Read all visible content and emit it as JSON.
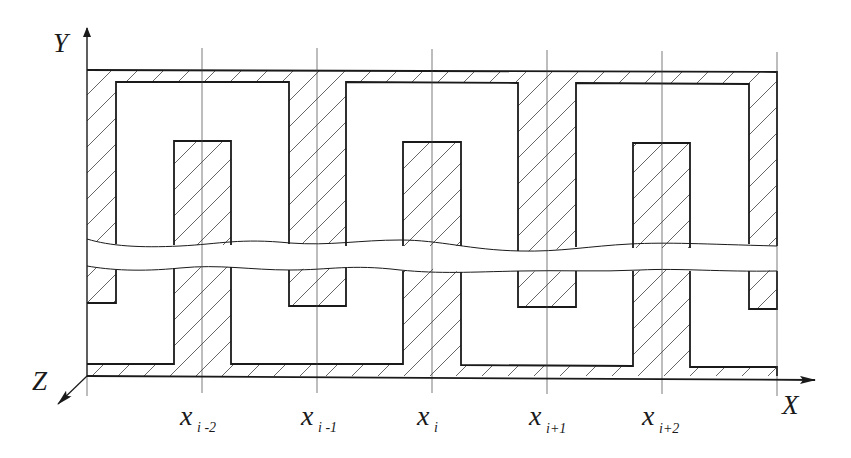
{
  "diagram": {
    "type": "cross-section schematic with periodic comb/interdigitated structure and break lines",
    "axes": {
      "y_label": "Y",
      "x_label": "X",
      "z_label": "Z"
    },
    "grid_positions": [
      {
        "name": "x",
        "sub": "i -2"
      },
      {
        "name": "x",
        "sub": "i -1"
      },
      {
        "name": "x",
        "sub": "i"
      },
      {
        "name": "x",
        "sub": "i+1"
      },
      {
        "name": "x",
        "sub": "i+2"
      }
    ],
    "colors": {
      "line": "#1a1a1a",
      "hatch": "#555555",
      "background": "#ffffff"
    },
    "hatch_pattern": "diagonal-45deg"
  }
}
